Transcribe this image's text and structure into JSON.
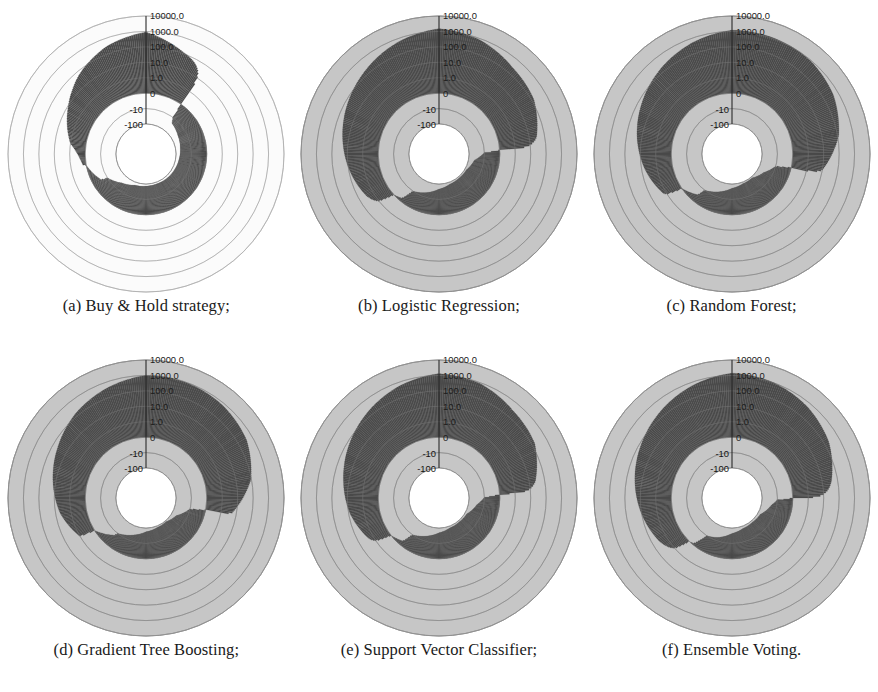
{
  "figure": {
    "title": "",
    "panel_count": 6,
    "layout": "2 rows x 3 columns"
  },
  "radial_axis": {
    "tick_labels": [
      "10000.0",
      "1000.0",
      "100.0",
      "10.0",
      "1.0",
      "0",
      "-10",
      "-100"
    ],
    "scale": "symlog (log above 1.0, linear/negative below 0)",
    "label_angle_deg": 90,
    "units": "cumulative return (%)"
  },
  "colors": {
    "disc_background": "#c6c6c6",
    "disc_background_light": "#fbfbfb",
    "data_fill": "#4a4a4a",
    "data_fill_dark": "#3c3c3c",
    "inner_white": "#ffffff",
    "grid_line": "#9a9a9a",
    "grid_line_light": "#d8d8d8",
    "axis_line": "#2a2a2a",
    "text": "#1a1a1a"
  },
  "panels": [
    {
      "id": "a",
      "caption": "(a) Buy & Hold strategy;",
      "background": "light",
      "chart_data": {
        "type": "area",
        "title": "Buy & Hold strategy",
        "projection": "polar",
        "rlabel": "cumulative return (%)",
        "rticks": [
          "10000.0",
          "1000.0",
          "100.0",
          "10.0",
          "1.0",
          "0",
          "-10",
          "-100"
        ],
        "grid": true,
        "legend": "none",
        "series": [
          {
            "name": "cumulative return",
            "theta_deg": [
              90,
              110,
              130,
              150,
              170,
              190,
              210,
              230,
              250,
              270,
              290,
              310,
              330,
              350,
              10,
              30,
              50,
              70
            ],
            "values": [
              900,
              300,
              60,
              8,
              1.2,
              0.2,
              -6,
              -55,
              -82,
              -88,
              -90,
              -88,
              -85,
              -80,
              -72,
              -60,
              -40,
              120
            ]
          }
        ],
        "annotations": [
          "positive lobe spans roughly 90deg to 200deg (upper-left quadrant)",
          "negative ring spans roughly 200deg through 360deg to 90deg",
          "white gap band near 195-215deg indicates values close to -100"
        ]
      }
    },
    {
      "id": "b",
      "caption": "(b) Logistic Regression;",
      "background": "gray",
      "chart_data": {
        "type": "area",
        "title": "Logistic Regression",
        "projection": "polar",
        "rlabel": "cumulative return (%)",
        "rticks": [
          "10000.0",
          "1000.0",
          "100.0",
          "10.0",
          "1.0",
          "0",
          "-10",
          "-100"
        ],
        "grid": true,
        "legend": "none",
        "series": [
          {
            "name": "cumulative return",
            "theta_deg": [
              90,
              110,
              130,
              150,
              170,
              190,
              210,
              230,
              250,
              270,
              290,
              310,
              330,
              350,
              10,
              30,
              50,
              70
            ],
            "values": [
              1500,
              600,
              200,
              70,
              25,
              9,
              3,
              -2,
              -35,
              -70,
              -88,
              -92,
              -90,
              -65,
              30,
              140,
              260,
              800
            ]
          }
        ],
        "annotations": [
          "large dark positive lobe covering the whole left half",
          "secondary positive wedge near 10-40deg on the right",
          "white near -100 band around 345-355deg"
        ]
      }
    },
    {
      "id": "c",
      "caption": "(c) Random Forest;",
      "background": "gray",
      "chart_data": {
        "type": "area",
        "title": "Random Forest",
        "projection": "polar",
        "rlabel": "cumulative return (%)",
        "rticks": [
          "10000.0",
          "1000.0",
          "100.0",
          "10.0",
          "1.0",
          "0",
          "-10",
          "-100"
        ],
        "grid": true,
        "legend": "none",
        "series": [
          {
            "name": "cumulative return",
            "theta_deg": [
              90,
              110,
              130,
              150,
              170,
              190,
              210,
              230,
              250,
              270,
              290,
              310,
              330,
              350,
              10,
              30,
              50,
              70
            ],
            "values": [
              1200,
              500,
              180,
              60,
              20,
              6,
              1.5,
              -5,
              -40,
              -75,
              -90,
              -93,
              -60,
              10,
              120,
              450,
              900,
              1100
            ]
          }
        ],
        "annotations": [
          "dark positive lobe across the left half reaching about 1000",
          "pronounced right-side wedge near 0-40deg reaching beyond 100",
          "white band close to -100 near 330-345deg"
        ]
      }
    },
    {
      "id": "d",
      "caption": "(d) Gradient Tree Boosting;",
      "background": "gray",
      "chart_data": {
        "type": "area",
        "title": "Gradient Tree Boosting",
        "projection": "polar",
        "rlabel": "cumulative return (%)",
        "rticks": [
          "10000.0",
          "1000.0",
          "100.0",
          "10.0",
          "1.0",
          "0",
          "-10",
          "-100"
        ],
        "grid": true,
        "legend": "none",
        "series": [
          {
            "name": "cumulative return",
            "theta_deg": [
              90,
              110,
              130,
              150,
              170,
              190,
              210,
              230,
              250,
              270,
              290,
              310,
              330,
              350,
              10,
              30,
              50,
              70
            ],
            "values": [
              1000,
              400,
              150,
              45,
              15,
              5,
              1.0,
              -8,
              -45,
              -78,
              -90,
              -94,
              -70,
              5,
              90,
              380,
              700,
              950
            ]
          }
        ],
        "annotations": [
          "dark positive lobe on the left half",
          "narrow bright wedge near 0-30deg on the right",
          "white low band near -100 around 330-350deg"
        ]
      }
    },
    {
      "id": "e",
      "caption": "(e) Support Vector Classifier;",
      "background": "gray",
      "chart_data": {
        "type": "area",
        "title": "Support Vector Classifier",
        "projection": "polar",
        "rlabel": "cumulative return (%)",
        "rticks": [
          "10000.0",
          "1000.0",
          "100.0",
          "10.0",
          "1.0",
          "0",
          "-10",
          "-100"
        ],
        "grid": true,
        "legend": "none",
        "series": [
          {
            "name": "cumulative return",
            "theta_deg": [
              90,
              110,
              130,
              150,
              170,
              190,
              210,
              230,
              250,
              270,
              290,
              310,
              330,
              350,
              10,
              30,
              50,
              70
            ],
            "values": [
              1300,
              550,
              190,
              65,
              22,
              8,
              2,
              -3,
              -38,
              -72,
              -89,
              -92,
              -88,
              -50,
              25,
              160,
              300,
              850
            ]
          }
        ],
        "annotations": [
          "broad dark positive lobe on the left half",
          "medium positive wedge around 20-55deg",
          "white near -100 band close to 350deg"
        ]
      }
    },
    {
      "id": "f",
      "caption": "(f) Ensemble Voting.",
      "background": "gray",
      "chart_data": {
        "type": "area",
        "title": "Ensemble Voting",
        "projection": "polar",
        "rlabel": "cumulative return (%)",
        "rticks": [
          "10000.0",
          "1000.0",
          "100.0",
          "10.0",
          "1.0",
          "0",
          "-10",
          "-100"
        ],
        "grid": true,
        "legend": "none",
        "series": [
          {
            "name": "cumulative return",
            "theta_deg": [
              90,
              110,
              130,
              150,
              170,
              190,
              210,
              230,
              250,
              270,
              290,
              310,
              330,
              350,
              10,
              30,
              50,
              70
            ],
            "values": [
              1400,
              580,
              210,
              75,
              28,
              10,
              3.5,
              -1,
              -30,
              -68,
              -86,
              -90,
              -84,
              -40,
              40,
              200,
              520,
              1000
            ]
          }
        ],
        "annotations": [
          "large dark positive lobe on the left half",
          "strong positive wedge spanning about 20-70deg",
          "white near -100 band around 345-358deg"
        ]
      }
    }
  ]
}
